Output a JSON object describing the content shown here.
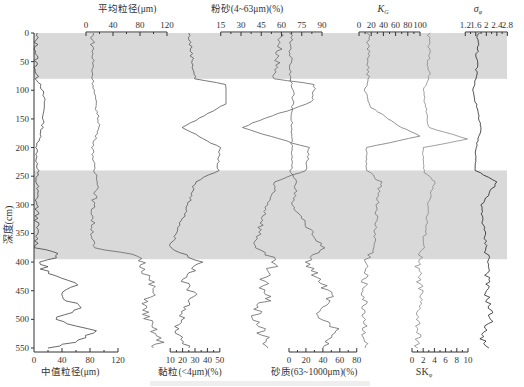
{
  "chart_data": {
    "type": "line",
    "title": "",
    "orientation": "depth-profile (vertical y = depth)",
    "ylabel": "深度(cm)",
    "ylim": [
      0,
      550
    ],
    "yticks": [
      0,
      50,
      100,
      150,
      200,
      250,
      300,
      350,
      400,
      450,
      500,
      550
    ],
    "shaded_bands_cm": [
      [
        0,
        80
      ],
      [
        240,
        395
      ]
    ],
    "shade_color": "#d9d9d9",
    "grid": false,
    "panels": [
      {
        "name": "中值粒径(μm)",
        "axis_position": "bottom",
        "ticks": [
          0,
          40,
          80,
          120
        ],
        "xlim": [
          0,
          120
        ],
        "profile": [
          [
            0,
            3
          ],
          [
            80,
            3
          ],
          [
            90,
            10
          ],
          [
            120,
            15
          ],
          [
            165,
            12
          ],
          [
            200,
            4
          ],
          [
            240,
            4
          ],
          [
            375,
            4
          ],
          [
            385,
            40
          ],
          [
            400,
            10
          ],
          [
            420,
            20
          ],
          [
            440,
            60
          ],
          [
            460,
            40
          ],
          [
            480,
            70
          ],
          [
            500,
            30
          ],
          [
            520,
            90
          ],
          [
            540,
            60
          ],
          [
            550,
            20
          ]
        ]
      },
      {
        "name": "平均粒径(μm)",
        "axis_position": "top",
        "ticks": [
          0,
          40,
          80,
          120
        ],
        "xlim": [
          0,
          120
        ],
        "profile": [
          [
            0,
            10
          ],
          [
            80,
            10
          ],
          [
            100,
            12
          ],
          [
            130,
            15
          ],
          [
            160,
            20
          ],
          [
            200,
            10
          ],
          [
            240,
            12
          ],
          [
            260,
            20
          ],
          [
            300,
            10
          ],
          [
            375,
            10
          ],
          [
            390,
            80
          ],
          [
            420,
            90
          ],
          [
            450,
            100
          ],
          [
            480,
            85
          ],
          [
            510,
            95
          ],
          [
            540,
            110
          ],
          [
            550,
            100
          ]
        ]
      },
      {
        "name": "黏粒(<4μm)(%)",
        "axis_position": "bottom",
        "ticks": [
          10,
          20,
          30,
          40,
          50
        ],
        "xlim": [
          5,
          55
        ],
        "profile": [
          [
            0,
            25
          ],
          [
            80,
            30
          ],
          [
            90,
            55
          ],
          [
            120,
            58
          ],
          [
            165,
            20
          ],
          [
            200,
            50
          ],
          [
            240,
            48
          ],
          [
            260,
            30
          ],
          [
            300,
            25
          ],
          [
            375,
            10
          ],
          [
            400,
            35
          ],
          [
            430,
            20
          ],
          [
            460,
            30
          ],
          [
            490,
            20
          ],
          [
            520,
            15
          ],
          [
            550,
            25
          ]
        ]
      },
      {
        "name": "粉砂(4~63μm)(%)",
        "axis_position": "top",
        "ticks": [
          15,
          30,
          45,
          60,
          75,
          90
        ],
        "xlim": [
          10,
          90
        ],
        "profile": [
          [
            0,
            60
          ],
          [
            80,
            55
          ],
          [
            90,
            85
          ],
          [
            120,
            82
          ],
          [
            165,
            30
          ],
          [
            200,
            80
          ],
          [
            240,
            78
          ],
          [
            260,
            55
          ],
          [
            300,
            50
          ],
          [
            375,
            40
          ],
          [
            400,
            55
          ],
          [
            430,
            45
          ],
          [
            460,
            50
          ],
          [
            490,
            40
          ],
          [
            520,
            45
          ],
          [
            550,
            50
          ]
        ]
      },
      {
        "name": "砂质(63~1000μm)(%)",
        "axis_position": "bottom",
        "ticks": [
          0,
          20,
          40,
          60,
          80
        ],
        "xlim": [
          0,
          85
        ],
        "profile": [
          [
            0,
            2
          ],
          [
            80,
            2
          ],
          [
            100,
            5
          ],
          [
            165,
            3
          ],
          [
            240,
            3
          ],
          [
            260,
            10
          ],
          [
            300,
            3
          ],
          [
            375,
            40
          ],
          [
            400,
            20
          ],
          [
            430,
            35
          ],
          [
            460,
            50
          ],
          [
            490,
            30
          ],
          [
            520,
            60
          ],
          [
            550,
            40
          ]
        ]
      },
      {
        "name": "Kg",
        "axis_position": "top",
        "ticks": [
          0,
          20,
          40,
          60,
          80,
          100
        ],
        "xlim": [
          0,
          100
        ],
        "profile": [
          [
            0,
            15
          ],
          [
            80,
            15
          ],
          [
            100,
            10
          ],
          [
            130,
            20
          ],
          [
            165,
            70
          ],
          [
            180,
            100
          ],
          [
            200,
            12
          ],
          [
            240,
            12
          ],
          [
            260,
            35
          ],
          [
            300,
            30
          ],
          [
            375,
            25
          ],
          [
            400,
            12
          ],
          [
            450,
            8
          ],
          [
            500,
            10
          ],
          [
            550,
            10
          ]
        ]
      },
      {
        "name": "SKφ",
        "axis_position": "bottom",
        "ticks": [
          0,
          2,
          4,
          6,
          8,
          10
        ],
        "xlim": [
          0,
          10
        ],
        "profile": [
          [
            0,
            3
          ],
          [
            80,
            3
          ],
          [
            100,
            2
          ],
          [
            165,
            3
          ],
          [
            185,
            10
          ],
          [
            200,
            2
          ],
          [
            240,
            2
          ],
          [
            260,
            4
          ],
          [
            300,
            3
          ],
          [
            375,
            2
          ],
          [
            400,
            1
          ],
          [
            450,
            1.5
          ],
          [
            500,
            1
          ],
          [
            550,
            1
          ]
        ]
      },
      {
        "name": "σφ",
        "axis_position": "top",
        "ticks": [
          1.2,
          1.6,
          2,
          2.4,
          2.8
        ],
        "xlim": [
          1.0,
          2.9
        ],
        "profile": [
          [
            0,
            1.7
          ],
          [
            80,
            1.6
          ],
          [
            100,
            1.5
          ],
          [
            165,
            1.8
          ],
          [
            200,
            1.6
          ],
          [
            240,
            1.6
          ],
          [
            260,
            2.4
          ],
          [
            300,
            1.8
          ],
          [
            375,
            2.0
          ],
          [
            400,
            2.1
          ],
          [
            450,
            2.0
          ],
          [
            500,
            2.2
          ],
          [
            530,
            1.8
          ],
          [
            550,
            2.1
          ]
        ]
      }
    ]
  },
  "labels": {
    "y_axis": "深度(cm)",
    "top": {
      "mean": "平均粒径(μm)",
      "silt": "粉砂(4~63μm)(%)",
      "kg_main": "K",
      "kg_sub": "G",
      "sigma_main": "σ",
      "sigma_sub": "φ"
    },
    "bottom": {
      "median": "中值粒径(μm)",
      "clay": "黏粒(<4μm)(%)",
      "sand": "砂质(63~1000μm)(%)",
      "sk_main": "SK",
      "sk_sub": "φ"
    }
  }
}
